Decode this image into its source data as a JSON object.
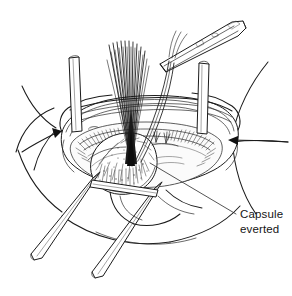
{
  "figure": {
    "domain": "medical-surgical-line-illustration",
    "medium": "black and white pen-and-ink line drawing",
    "background_color": "#ffffff",
    "ink_color": "#1b1b1b",
    "canvas": {
      "width": 292,
      "height": 296
    }
  },
  "annotations": [
    {
      "id": "capsule-everted",
      "line1": "Capsule",
      "line2": "everted",
      "text": "Capsule everted",
      "text_x": 240,
      "text_y": 218,
      "leader_from": {
        "x": 236,
        "y": 214
      },
      "leader_to": {
        "x": 150,
        "y": 163
      }
    }
  ],
  "arrows": [
    {
      "id": "left-capsule-arrow",
      "direction": "right-down",
      "tip_x": 60,
      "tip_y": 131
    },
    {
      "id": "right-capsule-arrow",
      "direction": "left",
      "tip_x": 228,
      "tip_y": 140
    }
  ],
  "instruments": [
    {
      "id": "needle-holder",
      "name": "needle holder forceps",
      "position": "top-right",
      "orientation": "diagonal"
    },
    {
      "id": "retractor-post-left",
      "name": "retractor post",
      "position": "upper-left-center",
      "orientation": "vertical"
    },
    {
      "id": "retractor-post-right",
      "name": "retractor post",
      "position": "upper-right-center",
      "orientation": "vertical"
    },
    {
      "id": "retractor-rod-outer",
      "name": "retractor rod",
      "position": "lower-left",
      "orientation": "diagonal"
    },
    {
      "id": "retractor-rod-inner",
      "name": "retractor rod",
      "position": "lower-center",
      "orientation": "diagonal"
    }
  ],
  "anatomy": [
    {
      "id": "suture-bundle",
      "name": "suture thread bundle",
      "count_approx": 22
    },
    {
      "id": "everted-capsule",
      "name": "everted capsule tissue"
    },
    {
      "id": "wound-rim",
      "name": "wound rim / incision edge"
    },
    {
      "id": "body-contour",
      "name": "surrounding body surface contours"
    },
    {
      "id": "suture-knots",
      "name": "tied suture knots"
    }
  ]
}
